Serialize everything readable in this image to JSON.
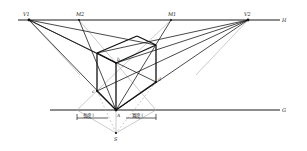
{
  "figure": {
    "colors": {
      "ink": "#1a1a1a",
      "construction": "#9a9a9a",
      "background": "#ffffff"
    }
  },
  "labels": {
    "v1": "V1",
    "m2": "M2",
    "m1": "M1",
    "v2": "V2",
    "horizon": "H",
    "ground": "G",
    "a": "A",
    "b": "b",
    "c": "c",
    "d": "d",
    "s": "S",
    "dim_left": "長度 l",
    "dim_right": "寬度 l"
  }
}
